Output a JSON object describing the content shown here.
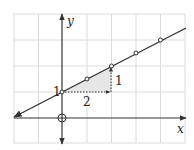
{
  "diagram": {
    "type": "coordinate-graph",
    "axes": {
      "x_label": "x",
      "y_label": "y",
      "origin_marker": "circle-cross"
    },
    "grid": {
      "x_min": -2,
      "x_max": 5,
      "y_min": -1,
      "y_max": 4,
      "color": "#d9d9d9"
    },
    "line": {
      "equation": "y = x/2 + 1",
      "slope": 0.5,
      "intercept": 1,
      "color": "#333333"
    },
    "points": [
      {
        "x": 0,
        "y": 1
      },
      {
        "x": 1,
        "y": 1.5
      },
      {
        "x": 2,
        "y": 2
      },
      {
        "x": 3,
        "y": 2.5
      },
      {
        "x": 4,
        "y": 3
      }
    ],
    "slope_triangle": {
      "run_label": "2",
      "rise_label": "1",
      "fill": "#e8e8e8"
    },
    "intercept_label": "1"
  }
}
